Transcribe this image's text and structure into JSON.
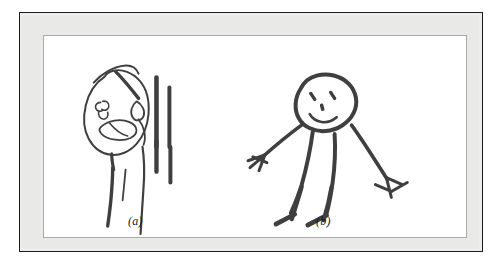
{
  "figure": {
    "kind": "scanned-illustration-plate",
    "caption_labels": [
      {
        "id": "a",
        "text": "(a)"
      },
      {
        "id": "b",
        "text": "(b)"
      }
    ],
    "colors": {
      "page_background": "#ffffff",
      "outer_rule": "#1c1c1c",
      "mat": "#e9e9e8",
      "inner_keyline": "#a9a9a9",
      "field": "#ffffff",
      "ink": "#3a3a3a",
      "ink_light": "#4a4a4a"
    },
    "panels": [
      {
        "id": "a",
        "label": "(a)",
        "title": "Child's drawing of a person, panel a",
        "description": "Crude outline head in profile with two eye marks, an open oval mouth, a thin neck and long legs, with two heavy vertical bars drawn to the right of the figure.",
        "parts": [
          "head-outline",
          "left-eye",
          "right-eye",
          "mouth",
          "hair-stroke",
          "neck",
          "left-leg",
          "right-leg",
          "short-stroke",
          "vertical-bar-inner",
          "vertical-bar-outer"
        ]
      },
      {
        "id": "b",
        "label": "(b)",
        "title": "Child's drawing of a person, panel b",
        "description": "Smiling round-headed stick figure with two eyes, a nose dot, a curved smiling mouth, two arms ending in splayed fingers and two legs ending in angled feet.",
        "parts": [
          "head-outline",
          "left-eye",
          "right-eye",
          "nose",
          "mouth",
          "left-arm",
          "left-hand",
          "right-arm",
          "right-hand",
          "torso-left",
          "torso-right",
          "left-leg",
          "left-foot",
          "right-leg",
          "right-foot"
        ]
      }
    ]
  }
}
